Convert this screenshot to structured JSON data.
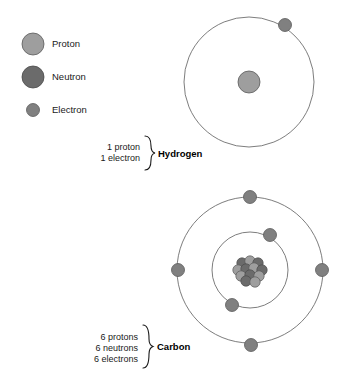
{
  "figure": {
    "background": "#ffffff"
  },
  "colors": {
    "proton": "#9e9e9e",
    "neutron": "#6b6b6b",
    "electron": "#808080",
    "particle_stroke": "#5a5a5a",
    "orbit_stroke": "#6e6e6e",
    "text": "#1a1a1a"
  },
  "legend": {
    "items": [
      {
        "label": "Proton",
        "color": "#9e9e9e",
        "radius": 11,
        "cx": 33,
        "cy": 44
      },
      {
        "label": "Neutron",
        "color": "#6b6b6b",
        "radius": 11,
        "cx": 33,
        "cy": 77
      },
      {
        "label": "Electron",
        "color": "#808080",
        "radius": 6.5,
        "cx": 33,
        "cy": 110
      }
    ],
    "label_x": 52
  },
  "atoms": [
    {
      "id": "hydrogen",
      "name": "Hydrogen",
      "name_x": 158,
      "name_y": 158,
      "counts": [
        "1 proton",
        "1 electron"
      ],
      "counts_x": 140,
      "counts_y_start": 150,
      "counts_line_height": 11,
      "brace_x": 144,
      "brace_top": 136,
      "brace_bottom": 170,
      "center": {
        "x": 249,
        "y": 82
      },
      "nucleus": {
        "type": "single",
        "particles": [
          {
            "kind": "proton",
            "dx": 0,
            "dy": 0,
            "r": 11
          }
        ]
      },
      "shells": [
        {
          "radius": 65,
          "electrons": [
            {
              "angle_deg": -60,
              "x": 285,
              "y": 25
            }
          ]
        }
      ]
    },
    {
      "id": "carbon",
      "name": "Carbon",
      "name_x": 152,
      "name_y": 351,
      "counts": [
        "6 protons",
        "6 neutrons",
        "6 electrons"
      ],
      "counts_x": 138,
      "counts_y_start": 340,
      "counts_line_height": 11,
      "brace_x": 142,
      "brace_top": 325,
      "brace_bottom": 368,
      "center": {
        "x": 250,
        "y": 270
      },
      "nucleus": {
        "type": "cluster",
        "particles": [
          {
            "kind": "neutron",
            "dx": -8,
            "dy": -7,
            "r": 5.2
          },
          {
            "kind": "proton",
            "dx": 0,
            "dy": -9,
            "r": 5.2
          },
          {
            "kind": "neutron",
            "dx": 8,
            "dy": -7,
            "r": 5.2
          },
          {
            "kind": "proton",
            "dx": -12,
            "dy": 0,
            "r": 5.2
          },
          {
            "kind": "neutron",
            "dx": -4,
            "dy": -1,
            "r": 5.2
          },
          {
            "kind": "proton",
            "dx": 4,
            "dy": -2,
            "r": 5.2
          },
          {
            "kind": "neutron",
            "dx": 12,
            "dy": 0,
            "r": 5.2
          },
          {
            "kind": "proton",
            "dx": -9,
            "dy": 6,
            "r": 5.2
          },
          {
            "kind": "neutron",
            "dx": 0,
            "dy": 5,
            "r": 5.2
          },
          {
            "kind": "proton",
            "dx": 9,
            "dy": 6,
            "r": 5.2
          },
          {
            "kind": "neutron",
            "dx": -4,
            "dy": 11,
            "r": 5.2
          },
          {
            "kind": "proton",
            "dx": 5,
            "dy": 12,
            "r": 5.2
          }
        ]
      },
      "shells": [
        {
          "radius": 38,
          "electrons": [
            {
              "angle_deg": -38,
              "x": 270,
              "y": 235
            },
            {
              "angle_deg": 152,
              "x": 232,
              "y": 305
            }
          ]
        },
        {
          "radius": 73,
          "electrons": [
            {
              "angle_deg": -90,
              "x": 250,
              "y": 197
            },
            {
              "angle_deg": 0,
              "x": 322,
              "y": 270
            },
            {
              "angle_deg": 90,
              "x": 251,
              "y": 345
            },
            {
              "angle_deg": 180,
              "x": 178,
              "y": 270
            }
          ]
        }
      ]
    }
  ]
}
